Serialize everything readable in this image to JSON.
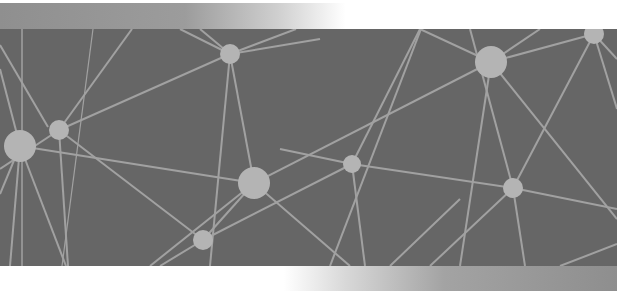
{
  "illustration": {
    "type": "network-graph",
    "colors": {
      "background": "#666666",
      "line": "#a8a8a8",
      "node": "#b4b4b4",
      "top_bar_start": "#8f8f8f",
      "bottom_bar_end": "#8e8e8e"
    },
    "nodes": [
      {
        "id": "n1",
        "x": 20,
        "y": 117,
        "r": 16
      },
      {
        "id": "n2",
        "x": 59,
        "y": 101,
        "r": 10
      },
      {
        "id": "n3",
        "x": 230,
        "y": 25,
        "r": 10
      },
      {
        "id": "n4",
        "x": 254,
        "y": 154,
        "r": 16
      },
      {
        "id": "n5",
        "x": 203,
        "y": 211,
        "r": 10
      },
      {
        "id": "n6",
        "x": 352,
        "y": 135,
        "r": 9
      },
      {
        "id": "n7",
        "x": 491,
        "y": 33,
        "r": 16
      },
      {
        "id": "n8",
        "x": 513,
        "y": 159,
        "r": 10
      },
      {
        "id": "n9",
        "x": 594,
        "y": 5,
        "r": 10
      }
    ]
  }
}
